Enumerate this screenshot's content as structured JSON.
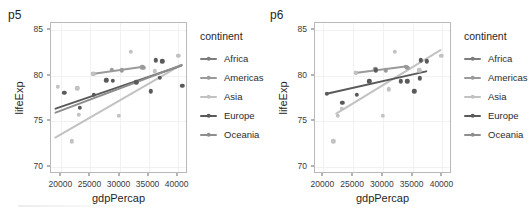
{
  "figure": {
    "background": "#ffffff",
    "panel_border": "#b9b9b9",
    "grid_color": "#f1f1f1"
  },
  "palette": {
    "Africa": "#7d7d7d",
    "Americas": "#9a9a9a",
    "Asia": "#c2c2c2",
    "Europe": "#5a5a5a",
    "Oceania": "#8e8e8e"
  },
  "legend": {
    "title": "continent",
    "items": [
      {
        "label": "Africa",
        "color": "#7d7d7d"
      },
      {
        "label": "Americas",
        "color": "#9a9a9a"
      },
      {
        "label": "Asia",
        "color": "#c2c2c2"
      },
      {
        "label": "Europe",
        "color": "#5a5a5a"
      },
      {
        "label": "Oceania",
        "color": "#8e8e8e"
      }
    ]
  },
  "chart_data": [
    {
      "id": "p5",
      "type": "scatter",
      "title": "p5",
      "xlabel": "gdpPercap",
      "ylabel": "lifeExp",
      "xlim": [
        18200,
        41800
      ],
      "ylim": [
        69.2,
        85.8
      ],
      "xticks": [
        20000,
        25000,
        30000,
        35000,
        40000
      ],
      "xtick_labels": [
        "20000",
        "25000",
        "30000",
        "35000",
        "40000"
      ],
      "yticks": [
        70,
        75,
        80,
        85
      ],
      "ytick_labels": [
        "70",
        "75",
        "80",
        "85"
      ],
      "grid": true,
      "legend_position": "right",
      "series": [
        {
          "name": "Africa",
          "color": "#7d7d7d",
          "points": [],
          "fit": null
        },
        {
          "name": "Americas",
          "color": "#9a9a9a",
          "points": [
            {
              "x": 25500,
              "y": 80.2
            },
            {
              "x": 28700,
              "y": 80.65
            },
            {
              "x": 30400,
              "y": 80.6
            },
            {
              "x": 33900,
              "y": 80.95
            },
            {
              "x": 34200,
              "y": 80.9
            }
          ],
          "fit": {
            "x1": 25400,
            "y1": 80.2,
            "x2": 34300,
            "y2": 81.0
          }
        },
        {
          "name": "Asia",
          "color": "#c2c2c2",
          "points": [
            {
              "x": 19400,
              "y": 78.8
            },
            {
              "x": 21800,
              "y": 72.8
            },
            {
              "x": 22700,
              "y": 78.6
            },
            {
              "x": 23000,
              "y": 75.7
            },
            {
              "x": 25500,
              "y": 80.2
            },
            {
              "x": 29900,
              "y": 75.6
            },
            {
              "x": 31900,
              "y": 82.6
            },
            {
              "x": 36100,
              "y": 80.5
            },
            {
              "x": 40100,
              "y": 82.2
            }
          ],
          "fit": {
            "x1": 18900,
            "y1": 73.2,
            "x2": 40900,
            "y2": 81.3
          }
        },
        {
          "name": "Europe",
          "color": "#5a5a5a",
          "points": [
            {
              "x": 20500,
              "y": 78.1
            },
            {
              "x": 23200,
              "y": 76.5
            },
            {
              "x": 25600,
              "y": 77.9
            },
            {
              "x": 27700,
              "y": 79.5
            },
            {
              "x": 28800,
              "y": 79.45
            },
            {
              "x": 32900,
              "y": 79.3
            },
            {
              "x": 35400,
              "y": 78.3
            },
            {
              "x": 36300,
              "y": 81.7
            },
            {
              "x": 37400,
              "y": 81.6
            },
            {
              "x": 36900,
              "y": 79.8
            },
            {
              "x": 40800,
              "y": 78.9
            }
          ],
          "fit": {
            "x1": 18900,
            "y1": 76.3,
            "x2": 40900,
            "y2": 81.1
          }
        },
        {
          "name": "Oceania",
          "color": "#8e8e8e",
          "points": [],
          "fit": {
            "x1": 18900,
            "y1": 75.9,
            "x2": 40900,
            "y2": 81.2
          }
        }
      ]
    },
    {
      "id": "p6",
      "type": "scatter",
      "title": "p6",
      "xlabel": "gdpPercap",
      "ylabel": "lifeExp",
      "xlim": [
        18600,
        41600
      ],
      "ylim": [
        69.2,
        85.8
      ],
      "xticks": [
        20000,
        25000,
        30000,
        35000,
        40000
      ],
      "xtick_labels": [
        "20000",
        "25000",
        "30000",
        "35000",
        "40000"
      ],
      "yticks": [
        70,
        75,
        80,
        85
      ],
      "ytick_labels": [
        "70",
        "75",
        "80",
        "85"
      ],
      "grid": true,
      "legend_position": "right",
      "series": [
        {
          "name": "Africa",
          "color": "#7d7d7d",
          "points": [],
          "fit": null
        },
        {
          "name": "Americas",
          "color": "#9a9a9a",
          "points": [
            {
              "x": 25500,
              "y": 80.3
            },
            {
              "x": 28700,
              "y": 80.7
            },
            {
              "x": 30500,
              "y": 80.6
            },
            {
              "x": 33800,
              "y": 81.0
            },
            {
              "x": 34100,
              "y": 80.9
            }
          ],
          "fit": {
            "x1": 25400,
            "y1": 80.25,
            "x2": 34200,
            "y2": 81.0
          }
        },
        {
          "name": "Asia",
          "color": "#c2c2c2",
          "points": [
            {
              "x": 21700,
              "y": 72.8
            },
            {
              "x": 22400,
              "y": 75.6
            },
            {
              "x": 23100,
              "y": 76.4
            },
            {
              "x": 25500,
              "y": 80.3
            },
            {
              "x": 30000,
              "y": 75.6
            },
            {
              "x": 31000,
              "y": 78.5
            },
            {
              "x": 32000,
              "y": 82.6
            },
            {
              "x": 36100,
              "y": 80.6
            },
            {
              "x": 39800,
              "y": 82.2
            }
          ],
          "fit": {
            "x1": 22100,
            "y1": 75.8,
            "x2": 39900,
            "y2": 82.9
          }
        },
        {
          "name": "Europe",
          "color": "#5a5a5a",
          "points": [
            {
              "x": 20600,
              "y": 78.0
            },
            {
              "x": 23200,
              "y": 77.0
            },
            {
              "x": 25600,
              "y": 77.9
            },
            {
              "x": 27700,
              "y": 79.4
            },
            {
              "x": 28800,
              "y": 80.6
            },
            {
              "x": 33000,
              "y": 79.4
            },
            {
              "x": 34100,
              "y": 79.4
            },
            {
              "x": 35300,
              "y": 78.3
            },
            {
              "x": 36200,
              "y": 79.7
            },
            {
              "x": 36400,
              "y": 81.7
            },
            {
              "x": 37400,
              "y": 81.6
            }
          ],
          "fit": {
            "x1": 20500,
            "y1": 78.0,
            "x2": 37500,
            "y2": 80.5
          }
        },
        {
          "name": "Oceania",
          "color": "#8e8e8e",
          "points": [],
          "fit": null
        }
      ]
    }
  ]
}
